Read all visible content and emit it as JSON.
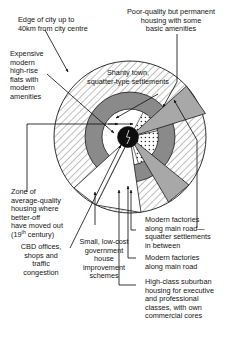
{
  "diagram": {
    "type": "concentric-zone-sector-model",
    "colors": {
      "cbd_core": "#0d0d0d",
      "inner_white_ring": "#ffffff",
      "dotted_ring": "#ffffff",
      "dark_grey_ring": "#8a8a8a",
      "hatched_outer_ring": "#ffffff",
      "road_wedge_grey": "#a8a8a8",
      "outline": "#1a1a1a"
    },
    "geometry": {
      "center_x": 130,
      "center_y": 137,
      "outer_radius": 76,
      "dark_ring_radius": 45,
      "inner_ring_radius": 28,
      "core_radius": 10
    }
  },
  "labels": {
    "edge_of_city": "Edge of city up to\n40km from city centre",
    "expensive_flats": "Expensive\nmodern\nhigh-rise\nflats with\nmodern\namenities",
    "poor_quality": "Poor-quality but permanent\nhousing with some\nbasic amenities",
    "shanty_town": "Shanty town,\nsquatter-type settlements",
    "zone_average_line1": "Zone of",
    "zone_average_line2": "average-quality",
    "zone_average_line3": "housing where",
    "zone_average_line4": "better-off",
    "zone_average_line5": "have moved out",
    "zone_average_line6_pre": "(19",
    "zone_average_line6_sup": "th",
    "zone_average_line6_post": " century)",
    "cbd_offices": "CBD offices,\nshops and\ntraffic\ncongestion",
    "low_cost_schemes": "Small, low-cost\ngovernment\nhouse\nimprovement\nschemes",
    "modern_factories_squatter": "Modern factories\nalong main road—\nsquatter settlements\nin between",
    "modern_factories_main_road": "Modern factories\nalong main road",
    "high_class_suburban": "High-class suburban\nhousing for executive\nand professional\nclasses, with own\ncommercial cores"
  },
  "label_text_plain": {
    "edge_of_city_1": "Edge of city up to",
    "edge_of_city_2": "40km from city centre",
    "expensive_1": "Expensive",
    "expensive_2": "modern",
    "expensive_3": "high-rise",
    "expensive_4": "flats with",
    "expensive_5": "modern",
    "expensive_6": "amenities",
    "poor_1": "Poor-quality but permanent",
    "poor_2": "housing with some",
    "poor_3": "basic amenities",
    "shanty_1": "Shanty town,",
    "shanty_2": "squatter-type settlements",
    "cbd_1": "CBD offices,",
    "cbd_2": "shops and",
    "cbd_3": "traffic",
    "cbd_4": "congestion",
    "lowcost_1": "Small, low-cost",
    "lowcost_2": "government",
    "lowcost_3": "house",
    "lowcost_4": "improvement",
    "lowcost_5": "schemes",
    "factsq_1": "Modern factories",
    "factsq_2": "along main road—",
    "factsq_3": "squatter settlements",
    "factsq_4": "in between",
    "factmr_1": "Modern factories",
    "factmr_2": "along main road",
    "high_1": "High-class suburban",
    "high_2": "housing for executive",
    "high_3": "and professional",
    "high_4": "classes, with own",
    "high_5": "commercial cores"
  }
}
